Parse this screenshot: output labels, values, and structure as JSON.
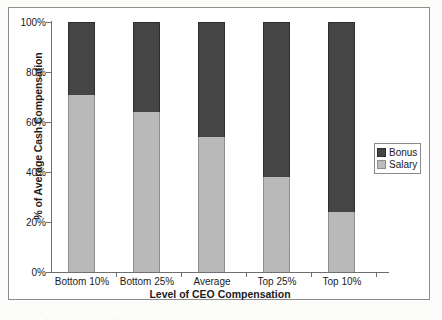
{
  "chart_data": {
    "type": "bar",
    "stacked": true,
    "title": "",
    "xlabel": "Level of CEO Compensation",
    "ylabel": "% of Average Cash Compensation",
    "categories": [
      "Bottom 10%",
      "Bottom 25%",
      "Average",
      "Top 25%",
      "Top 10%"
    ],
    "series": [
      {
        "name": "Salary",
        "color": "#b9b9b9",
        "values": [
          71,
          64,
          54,
          38,
          24
        ]
      },
      {
        "name": "Bonus",
        "color": "#454545",
        "values": [
          29,
          36,
          46,
          62,
          76
        ]
      }
    ],
    "ylim": [
      0,
      100
    ],
    "yticks": [
      "0%",
      "20%",
      "40%",
      "60%",
      "80%",
      "100%"
    ],
    "ytick_values": [
      0,
      20,
      40,
      60,
      80,
      100
    ],
    "grid": false,
    "legend_position": "right-inside",
    "legend_order": [
      "Bonus",
      "Salary"
    ]
  },
  "legend": {
    "items": [
      {
        "label": "Bonus",
        "color": "#454545"
      },
      {
        "label": "Salary",
        "color": "#b9b9b9"
      }
    ]
  },
  "footnote": "",
  "colors": {
    "bonus": "#454545",
    "salary": "#b9b9b9",
    "axis": "#6f6f6f",
    "frame": "#8d8d8d",
    "text": "#1c1c1c"
  }
}
